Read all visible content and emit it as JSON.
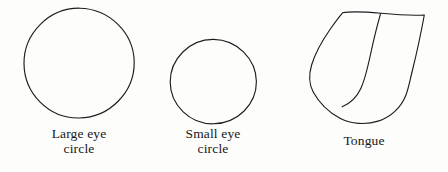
{
  "figure": {
    "background_color": "#fdfdfc",
    "ink_color": "#1d1d20",
    "style": "hand-drawn line sketch",
    "shapes": [
      {
        "id": "large-eye-circle",
        "kind": "circle",
        "caption": "Large eye\ncircle",
        "center_x": 79,
        "center_y": 63,
        "radius": 55
      },
      {
        "id": "small-eye-circle",
        "kind": "circle",
        "caption": "Small eye\ncircle",
        "center_x": 213,
        "center_y": 82,
        "radius": 43
      },
      {
        "id": "tongue",
        "kind": "tongue-outline",
        "caption": "Tongue",
        "has_median_line": true
      }
    ]
  },
  "captions": {
    "large_eye_circle": "Large eye\ncircle",
    "small_eye_circle": "Small eye\ncircle",
    "tongue": "Tongue"
  }
}
